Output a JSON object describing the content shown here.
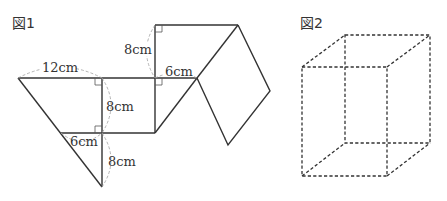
{
  "figure1": {
    "label": "図1",
    "dimensions": {
      "top_width": "12cm",
      "upper_height": "8cm",
      "middle_height": "8cm",
      "middle_width": "6cm",
      "lower_width": "6cm",
      "lower_height": "8cm"
    }
  },
  "figure2": {
    "label": "図2"
  },
  "colors": {
    "line": "#333333",
    "guide": "#aaaaaa"
  }
}
